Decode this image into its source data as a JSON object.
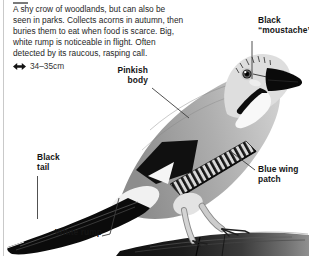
{
  "description": {
    "lines": [
      "A shy crow of woodlands, but can also be",
      "seen in parks. Collects acorns in autumn, then",
      "buries them to eat when food is scarce. Big,",
      "white rump is noticeable in flight. Often",
      "detected by its raucous, rasping call."
    ]
  },
  "size_indicator": {
    "icon": "double-arrow-icon",
    "value": "34–35cm"
  },
  "annotations": {
    "moustache": {
      "label": "Black “moustache”"
    },
    "pinkish_body": {
      "label": "Pinkish body"
    },
    "black_tail": {
      "label": "Black tail"
    },
    "white_rump": {
      "label": "White rump"
    },
    "blue_wing_patch": {
      "label": "Blue wing patch"
    }
  },
  "illustration": {
    "subject": "jay perched on a branch, black-and-white photograph",
    "colors": {
      "ink": "#141414",
      "rule": "#c9c9c9",
      "body_gray": "#a8a8a8",
      "branch_dark": "#1d1d1d",
      "patch_light": "#d8d8d8"
    }
  }
}
